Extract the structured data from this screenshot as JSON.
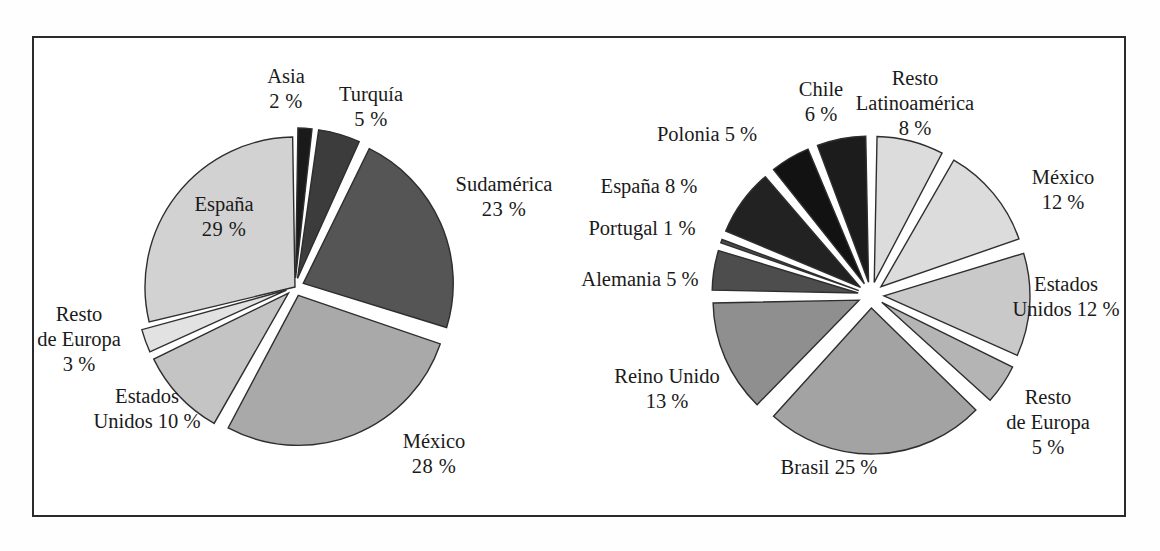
{
  "figure": {
    "background_color": "#ffffff",
    "frame_color": "#2b2b2b",
    "label_color": "#1a1a1a",
    "slice_outline_color": "#2e2e2e",
    "percent_symbol": "%"
  },
  "chart_data": [
    {
      "type": "pie",
      "name": "left-pie",
      "title": "",
      "subtitle": "",
      "xlabel": "",
      "ylabel": "",
      "grid": false,
      "legend_position": "none",
      "labels_position": "outside-and-inside",
      "units": "percent",
      "total": 100,
      "start_angle_deg": -90,
      "direction": "clockwise",
      "categories": [
        "Asia",
        "Turquía",
        "Sudamérica",
        "México",
        "Estados Unidos",
        "Resto de Europa",
        "España"
      ],
      "values": [
        2,
        5,
        23,
        28,
        10,
        3,
        29
      ],
      "slices": [
        {
          "label": "Asia",
          "label_line1": "Asia",
          "value": 2,
          "value_text": "2 %",
          "color": "#1a1a1a",
          "exploded": true,
          "label_placement": "outside-top"
        },
        {
          "label": "Turquía",
          "label_line1": "Turquía",
          "value": 5,
          "value_text": "5 %",
          "color": "#3c3c3c",
          "exploded": true,
          "label_placement": "outside-top"
        },
        {
          "label": "Sudamérica",
          "label_line1": "Sudamérica",
          "value": 23,
          "value_text": "23 %",
          "color": "#555555",
          "exploded": true,
          "label_placement": "outside-right"
        },
        {
          "label": "México",
          "label_line1": "México",
          "value": 28,
          "value_text": "28 %",
          "color": "#a9a9a9",
          "exploded": true,
          "label_placement": "outside-bottom-right"
        },
        {
          "label": "Estados Unidos",
          "label_line1": "Estados",
          "label_line2": "Unidos 10 %",
          "value": 10,
          "value_text": "10 %",
          "color": "#c4c4c4",
          "exploded": true,
          "label_placement": "outside-bottom-left"
        },
        {
          "label": "Resto de Europa",
          "label_line1": "Resto",
          "label_line2": "de Europa",
          "label_line3": "3 %",
          "value": 3,
          "value_text": "3 %",
          "color": "#e2e2e2",
          "exploded": true,
          "label_placement": "outside-left"
        },
        {
          "label": "España",
          "label_line1": "España",
          "value": 29,
          "value_text": "29 %",
          "color": "#d2d2d2",
          "exploded": false,
          "label_placement": "inside"
        }
      ]
    },
    {
      "type": "pie",
      "name": "right-pie",
      "title": "",
      "subtitle": "",
      "xlabel": "",
      "ylabel": "",
      "grid": false,
      "legend_position": "none",
      "labels_position": "outside",
      "units": "percent",
      "total": 100,
      "start_angle_deg": -90,
      "direction": "clockwise",
      "categories": [
        "Resto Latinoamérica",
        "México",
        "Estados Unidos",
        "Resto de Europa",
        "Brasil",
        "Reino Unido",
        "Alemania",
        "Portugal",
        "España",
        "Polonia",
        "Chile"
      ],
      "values": [
        8,
        12,
        12,
        5,
        25,
        13,
        5,
        1,
        8,
        5,
        6
      ],
      "slices": [
        {
          "label": "Resto Latinoamérica",
          "label_line1": "Resto",
          "label_line2": "Latinoamérica",
          "label_line3": "8 %",
          "value": 8,
          "value_text": "8 %",
          "color": "#dcdcdc",
          "exploded": true,
          "label_placement": "outside-top"
        },
        {
          "label": "México",
          "label_line1": "México",
          "label_line2": "12 %",
          "value": 12,
          "value_text": "12 %",
          "color": "#dcdcdc",
          "exploded": true,
          "label_placement": "outside-right"
        },
        {
          "label": "Estados Unidos",
          "label_line1": "Estados",
          "label_line2": "Unidos 12 %",
          "value": 12,
          "value_text": "12 %",
          "color": "#c9c9c9",
          "exploded": true,
          "label_placement": "outside-right"
        },
        {
          "label": "Resto de Europa",
          "label_line1": "Resto",
          "label_line2": "de Europa",
          "label_line3": "5 %",
          "value": 5,
          "value_text": "5 %",
          "color": "#b4b4b4",
          "exploded": true,
          "label_placement": "outside-bottom-right"
        },
        {
          "label": "Brasil",
          "label_line1": "Brasil 25 %",
          "value": 25,
          "value_text": "25 %",
          "color": "#a3a3a3",
          "exploded": true,
          "label_placement": "outside-bottom"
        },
        {
          "label": "Reino Unido",
          "label_line1": "Reino Unido",
          "label_line2": "13 %",
          "value": 13,
          "value_text": "13 %",
          "color": "#8f8f8f",
          "exploded": true,
          "label_placement": "outside-left"
        },
        {
          "label": "Alemania",
          "label_line1": "Alemania 5 %",
          "value": 5,
          "value_text": "5 %",
          "color": "#4d4d4d",
          "exploded": true,
          "label_placement": "outside-left"
        },
        {
          "label": "Portugal",
          "label_line1": "Portugal 1 %",
          "value": 1,
          "value_text": "1 %",
          "color": "#4a4a4a",
          "exploded": true,
          "label_placement": "outside-left"
        },
        {
          "label": "España",
          "label_line1": "España 8 %",
          "value": 8,
          "value_text": "8 %",
          "color": "#222222",
          "exploded": true,
          "label_placement": "outside-left"
        },
        {
          "label": "Polonia",
          "label_line1": "Polonia 5 %",
          "value": 5,
          "value_text": "5 %",
          "color": "#121212",
          "exploded": true,
          "label_placement": "outside-top-left"
        },
        {
          "label": "Chile",
          "label_line1": "Chile",
          "label_line2": "6 %",
          "value": 6,
          "value_text": "6 %",
          "color": "#1c1c1c",
          "exploded": true,
          "label_placement": "outside-top"
        }
      ]
    }
  ]
}
